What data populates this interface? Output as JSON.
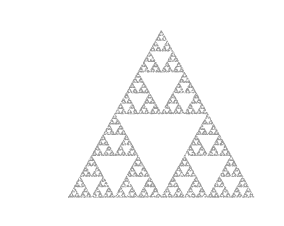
{
  "page": {
    "width": 284,
    "height": 226,
    "background_color": "#ffffff"
  },
  "frame": {
    "name": "partial-border-frame",
    "line_color": "#9a9a9a",
    "top_rule": {
      "x": 11,
      "y": 5,
      "length": 273,
      "thickness": 1
    },
    "left_rule": {
      "x": 11,
      "y": 5,
      "length": 221,
      "thickness": 1
    }
  },
  "figure": {
    "title": "",
    "caption": ""
  },
  "chart_data": {
    "type": "scatter",
    "title": "",
    "subtitle": "",
    "xlabel": "",
    "ylabel": "",
    "grid": false,
    "legend": null,
    "axes_visible": false,
    "tick_labels_x": [],
    "tick_labels_y": [],
    "xlim": [
      0,
      284
    ],
    "ylim": [
      0,
      226
    ],
    "fractal": {
      "name": "Sierpinski triangle",
      "method": "chaos-game",
      "iterations": 60000,
      "burn_in": 20,
      "contraction_ratio": 0.5,
      "recursion_depth_visible": 6,
      "point_color": "#9b9b9b",
      "point_size": 0.6,
      "point_opacity": 0.55,
      "vertices": [
        {
          "label": "apex",
          "x": 161,
          "y": 30
        },
        {
          "label": "bottom-left",
          "x": 68,
          "y": 197
        },
        {
          "label": "bottom-right",
          "x": 254,
          "y": 197
        }
      ],
      "bounding_box": {
        "x": 68,
        "y": 30,
        "width": 186,
        "height": 167
      }
    }
  }
}
